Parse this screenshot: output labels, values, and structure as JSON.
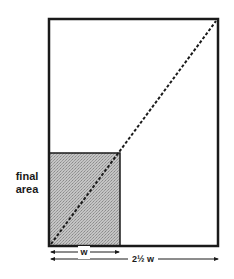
{
  "diagram": {
    "type": "geometric-ratio-diagram",
    "outer_rect": {
      "label": "full sheet",
      "width_label": "2½ w"
    },
    "inner_rect": {
      "label_line1": "final",
      "label_line2": "area",
      "width_label": "w",
      "fill": "#b8b8b8"
    },
    "diagonal": {
      "style": "dashed",
      "from": "bottom-left",
      "to": "top-right"
    },
    "dimensions": {
      "short": "w",
      "long": "2½ w"
    },
    "colors": {
      "stroke": "#1a1a1a",
      "shade": "#b8b8b8",
      "background": "#ffffff"
    }
  }
}
